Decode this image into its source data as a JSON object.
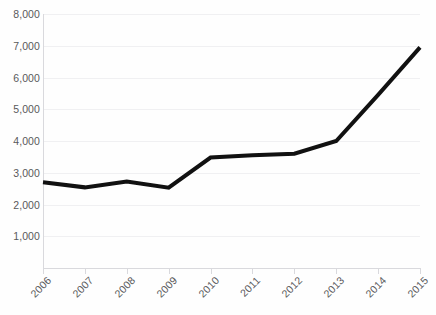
{
  "chart_data": {
    "type": "line",
    "title": "",
    "subtitle": "",
    "xlabel": "",
    "ylabel": "",
    "categories": [
      "2006",
      "2007",
      "2008",
      "2009",
      "2010",
      "2011",
      "2012",
      "2013",
      "2014",
      "2015"
    ],
    "series": [
      {
        "name": "",
        "values": [
          2700,
          2540,
          2720,
          2530,
          3480,
          3550,
          3600,
          4000,
          5450,
          6950
        ],
        "color": "#111111",
        "line_width": 4
      }
    ],
    "ylim": [
      0,
      8000
    ],
    "yticks": [
      1000,
      2000,
      3000,
      4000,
      5000,
      6000,
      7000,
      8000
    ],
    "ytick_labels": [
      "1,000",
      "2,000",
      "3,000",
      "4,000",
      "5,000",
      "6,000",
      "7,000",
      "8,000"
    ],
    "xtick_labels": [
      "2006",
      "2007",
      "2008",
      "2009",
      "2010",
      "2011",
      "2012",
      "2013",
      "2014",
      "2015"
    ],
    "xtick_label_rotation": -45,
    "grid": true,
    "grid_axis": "y",
    "grid_color": "#f0f0f2",
    "legend": false,
    "legend_position": "none",
    "axis_color": "#d9d9dd",
    "tick_label_color": "#59595b",
    "background_color": "#fefefe",
    "annotations": []
  }
}
